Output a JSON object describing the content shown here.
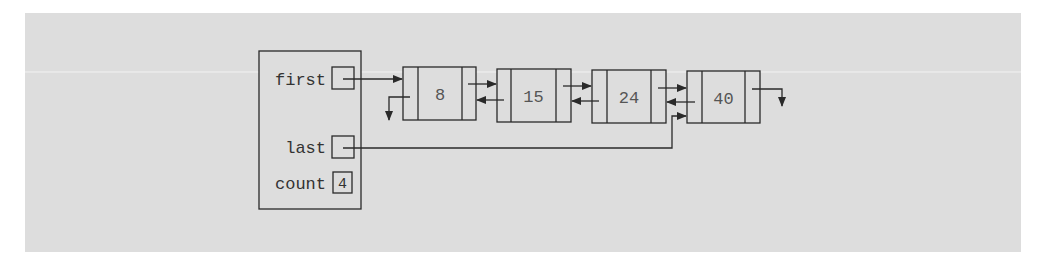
{
  "diagram": {
    "type": "doubly-linked-list",
    "colors": {
      "background": "#dddddd",
      "line": "#2a2a2a",
      "text": "#333333"
    },
    "header": {
      "fields": [
        {
          "label": "first",
          "kind": "pointer"
        },
        {
          "label": "last",
          "kind": "pointer"
        },
        {
          "label": "count",
          "kind": "value",
          "value": "4"
        }
      ]
    },
    "nodes": [
      {
        "info": "8"
      },
      {
        "info": "15"
      },
      {
        "info": "24"
      },
      {
        "info": "40"
      }
    ]
  }
}
